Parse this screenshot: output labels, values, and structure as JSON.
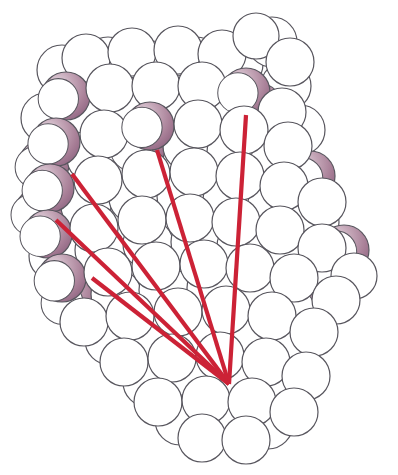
{
  "figure": {
    "title": "Space-filling molecular model with convergent vector overlay",
    "caption": "",
    "background_color": "#ffffff",
    "width": 398,
    "height": 475
  },
  "palette": {
    "atom_fill_light": "#ffffff",
    "atom_outline": "#58565e",
    "atom_shadow_mauve": "#a87f97",
    "atom_shadow_mauve_dark": "#8d6380",
    "atom_shadow_mauve_light": "#cdb2c3",
    "vector_red": "#cc2236",
    "vector_red_dark": "#a81b2b"
  },
  "model": {
    "representation": "space-filling",
    "sphere_outline_width_px": 1.2,
    "shaded_crescent_style": "mauve gradient crescent on lower-right of selected spheres"
  },
  "vectors": {
    "name": "convergent-red-lines",
    "count": 5,
    "stroke_width_px": 4.2,
    "convergence_point": {
      "x": 229,
      "y": 384
    },
    "lines": [
      {
        "id": "vector-1",
        "x1": 72,
        "y1": 174,
        "x2": 229,
        "y2": 384
      },
      {
        "id": "vector-2",
        "x1": 56,
        "y1": 220,
        "x2": 229,
        "y2": 384
      },
      {
        "id": "vector-3",
        "x1": 92,
        "y1": 278,
        "x2": 229,
        "y2": 384
      },
      {
        "id": "vector-4",
        "x1": 157,
        "y1": 150,
        "x2": 229,
        "y2": 384
      },
      {
        "id": "vector-5",
        "x1": 246,
        "y1": 115,
        "x2": 229,
        "y2": 384
      }
    ]
  },
  "atoms": {
    "note": "x, y = center in px; r = radius in px; m = mauve crescent angle in degrees (null = plain white sphere)",
    "layers": [
      {
        "name": "back-layer",
        "spheres": [
          {
            "x": 62,
            "y": 70,
            "r": 25,
            "m": null
          },
          {
            "x": 108,
            "y": 62,
            "r": 25,
            "m": null
          },
          {
            "x": 152,
            "y": 66,
            "r": 25,
            "m": null
          },
          {
            "x": 196,
            "y": 62,
            "r": 25,
            "m": null
          },
          {
            "x": 238,
            "y": 64,
            "r": 25,
            "m": null
          },
          {
            "x": 272,
            "y": 42,
            "r": 25,
            "m": null
          },
          {
            "x": 286,
            "y": 86,
            "r": 25,
            "m": null
          },
          {
            "x": 46,
            "y": 118,
            "r": 25,
            "m": null
          },
          {
            "x": 84,
            "y": 108,
            "r": 25,
            "m": null
          },
          {
            "x": 128,
            "y": 102,
            "r": 25,
            "m": 25
          },
          {
            "x": 176,
            "y": 100,
            "r": 25,
            "m": null
          },
          {
            "x": 224,
            "y": 104,
            "r": 25,
            "m": null
          },
          {
            "x": 258,
            "y": 108,
            "r": 25,
            "m": 30
          },
          {
            "x": 300,
            "y": 130,
            "r": 25,
            "m": null
          },
          {
            "x": 44,
            "y": 164,
            "r": 25,
            "m": 20
          },
          {
            "x": 92,
            "y": 158,
            "r": 25,
            "m": null
          },
          {
            "x": 140,
            "y": 148,
            "r": 25,
            "m": 30
          },
          {
            "x": 188,
            "y": 146,
            "r": 25,
            "m": null
          },
          {
            "x": 232,
            "y": 152,
            "r": 25,
            "m": null
          },
          {
            "x": 276,
            "y": 160,
            "r": 25,
            "m": null
          },
          {
            "x": 310,
            "y": 176,
            "r": 25,
            "m": 25
          },
          {
            "x": 40,
            "y": 212,
            "r": 25,
            "m": 22
          },
          {
            "x": 86,
            "y": 206,
            "r": 25,
            "m": null
          },
          {
            "x": 134,
            "y": 198,
            "r": 25,
            "m": null
          },
          {
            "x": 182,
            "y": 196,
            "r": 25,
            "m": null
          },
          {
            "x": 228,
            "y": 200,
            "r": 25,
            "m": null
          },
          {
            "x": 272,
            "y": 208,
            "r": 25,
            "m": null
          },
          {
            "x": 314,
            "y": 222,
            "r": 25,
            "m": null
          },
          {
            "x": 344,
            "y": 250,
            "r": 25,
            "m": 30
          },
          {
            "x": 54,
            "y": 256,
            "r": 25,
            "m": null
          },
          {
            "x": 100,
            "y": 250,
            "r": 25,
            "m": null
          },
          {
            "x": 148,
            "y": 244,
            "r": 25,
            "m": null
          },
          {
            "x": 196,
            "y": 242,
            "r": 25,
            "m": null
          },
          {
            "x": 242,
            "y": 246,
            "r": 25,
            "m": null
          },
          {
            "x": 286,
            "y": 254,
            "r": 25,
            "m": null
          },
          {
            "x": 330,
            "y": 276,
            "r": 25,
            "m": 28
          },
          {
            "x": 70,
            "y": 300,
            "r": 25,
            "m": 20
          },
          {
            "x": 116,
            "y": 294,
            "r": 25,
            "m": null
          },
          {
            "x": 164,
            "y": 290,
            "r": 25,
            "m": null
          },
          {
            "x": 212,
            "y": 288,
            "r": 25,
            "m": null
          },
          {
            "x": 258,
            "y": 294,
            "r": 25,
            "m": null
          },
          {
            "x": 302,
            "y": 308,
            "r": 25,
            "m": 30
          },
          {
            "x": 110,
            "y": 340,
            "r": 25,
            "m": null
          },
          {
            "x": 158,
            "y": 336,
            "r": 25,
            "m": null
          },
          {
            "x": 206,
            "y": 334,
            "r": 25,
            "m": null
          },
          {
            "x": 252,
            "y": 338,
            "r": 25,
            "m": null
          },
          {
            "x": 294,
            "y": 350,
            "r": 25,
            "m": null
          },
          {
            "x": 148,
            "y": 382,
            "r": 25,
            "m": null
          },
          {
            "x": 196,
            "y": 380,
            "r": 25,
            "m": null
          },
          {
            "x": 240,
            "y": 382,
            "r": 25,
            "m": 30
          },
          {
            "x": 284,
            "y": 392,
            "r": 25,
            "m": null
          },
          {
            "x": 180,
            "y": 420,
            "r": 25,
            "m": null
          },
          {
            "x": 226,
            "y": 422,
            "r": 25,
            "m": null
          },
          {
            "x": 268,
            "y": 424,
            "r": 25,
            "m": null
          }
        ]
      },
      {
        "name": "front-layer",
        "spheres": [
          {
            "x": 86,
            "y": 58,
            "r": 24,
            "m": null
          },
          {
            "x": 132,
            "y": 52,
            "r": 24,
            "m": null
          },
          {
            "x": 178,
            "y": 50,
            "r": 24,
            "m": null
          },
          {
            "x": 222,
            "y": 54,
            "r": 24,
            "m": null
          },
          {
            "x": 256,
            "y": 36,
            "r": 23,
            "m": null
          },
          {
            "x": 290,
            "y": 62,
            "r": 24,
            "m": null
          },
          {
            "x": 66,
            "y": 96,
            "r": 24,
            "m": 22
          },
          {
            "x": 110,
            "y": 88,
            "r": 24,
            "m": null
          },
          {
            "x": 156,
            "y": 86,
            "r": 24,
            "m": null
          },
          {
            "x": 202,
            "y": 86,
            "r": 24,
            "m": null
          },
          {
            "x": 246,
            "y": 92,
            "r": 24,
            "m": 35
          },
          {
            "x": 282,
            "y": 112,
            "r": 24,
            "m": null
          },
          {
            "x": 56,
            "y": 142,
            "r": 24,
            "m": 28
          },
          {
            "x": 104,
            "y": 134,
            "r": 24,
            "m": null
          },
          {
            "x": 150,
            "y": 126,
            "r": 24,
            "m": 32
          },
          {
            "x": 198,
            "y": 124,
            "r": 24,
            "m": null
          },
          {
            "x": 244,
            "y": 130,
            "r": 24,
            "m": null
          },
          {
            "x": 288,
            "y": 146,
            "r": 24,
            "m": null
          },
          {
            "x": 50,
            "y": 188,
            "r": 24,
            "m": 24
          },
          {
            "x": 98,
            "y": 180,
            "r": 24,
            "m": null
          },
          {
            "x": 146,
            "y": 174,
            "r": 24,
            "m": null
          },
          {
            "x": 194,
            "y": 172,
            "r": 24,
            "m": null
          },
          {
            "x": 240,
            "y": 176,
            "r": 24,
            "m": null
          },
          {
            "x": 284,
            "y": 186,
            "r": 24,
            "m": null
          },
          {
            "x": 322,
            "y": 202,
            "r": 24,
            "m": null
          },
          {
            "x": 48,
            "y": 234,
            "r": 24,
            "m": 26
          },
          {
            "x": 94,
            "y": 228,
            "r": 24,
            "m": null
          },
          {
            "x": 142,
            "y": 220,
            "r": 24,
            "m": null
          },
          {
            "x": 190,
            "y": 218,
            "r": 24,
            "m": null
          },
          {
            "x": 236,
            "y": 222,
            "r": 24,
            "m": null
          },
          {
            "x": 280,
            "y": 230,
            "r": 24,
            "m": null
          },
          {
            "x": 322,
            "y": 248,
            "r": 24,
            "m": null
          },
          {
            "x": 354,
            "y": 276,
            "r": 23,
            "m": null
          },
          {
            "x": 62,
            "y": 278,
            "r": 24,
            "m": 22
          },
          {
            "x": 108,
            "y": 272,
            "r": 24,
            "m": null
          },
          {
            "x": 156,
            "y": 266,
            "r": 24,
            "m": null
          },
          {
            "x": 204,
            "y": 264,
            "r": 24,
            "m": null
          },
          {
            "x": 250,
            "y": 268,
            "r": 24,
            "m": null
          },
          {
            "x": 294,
            "y": 278,
            "r": 24,
            "m": null
          },
          {
            "x": 336,
            "y": 300,
            "r": 24,
            "m": null
          },
          {
            "x": 84,
            "y": 322,
            "r": 24,
            "m": null
          },
          {
            "x": 130,
            "y": 316,
            "r": 24,
            "m": null
          },
          {
            "x": 178,
            "y": 312,
            "r": 24,
            "m": null
          },
          {
            "x": 226,
            "y": 310,
            "r": 24,
            "m": null
          },
          {
            "x": 272,
            "y": 316,
            "r": 24,
            "m": null
          },
          {
            "x": 314,
            "y": 332,
            "r": 24,
            "m": null
          },
          {
            "x": 124,
            "y": 362,
            "r": 24,
            "m": null
          },
          {
            "x": 172,
            "y": 358,
            "r": 24,
            "m": null
          },
          {
            "x": 220,
            "y": 356,
            "r": 24,
            "m": null
          },
          {
            "x": 266,
            "y": 362,
            "r": 24,
            "m": null
          },
          {
            "x": 306,
            "y": 376,
            "r": 24,
            "m": null
          },
          {
            "x": 158,
            "y": 402,
            "r": 24,
            "m": null
          },
          {
            "x": 206,
            "y": 400,
            "r": 24,
            "m": null
          },
          {
            "x": 252,
            "y": 402,
            "r": 24,
            "m": null
          },
          {
            "x": 294,
            "y": 412,
            "r": 24,
            "m": null
          },
          {
            "x": 202,
            "y": 438,
            "r": 24,
            "m": null
          },
          {
            "x": 246,
            "y": 440,
            "r": 24,
            "m": null
          }
        ]
      }
    ]
  }
}
